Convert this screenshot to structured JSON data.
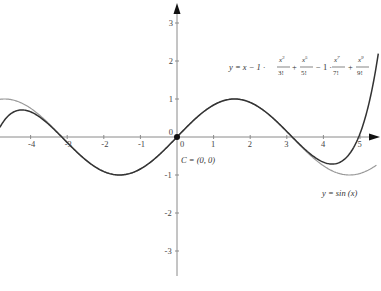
{
  "chart_data": {
    "type": "line",
    "title": "",
    "xlabel": "",
    "ylabel": "",
    "xlim": [
      -4.84,
      5.5
    ],
    "ylim": [
      -3.6,
      3.5
    ],
    "grid": false,
    "x_ticks": [
      -4,
      -3,
      -2,
      -1,
      0,
      1,
      2,
      3,
      4,
      5
    ],
    "x_tick_labels": [
      "-4",
      "-3",
      "-2",
      "-1",
      "0",
      "1",
      "2",
      "3",
      "4",
      "5"
    ],
    "y_ticks": [
      -3,
      -2,
      -1,
      0,
      1,
      2,
      3
    ],
    "y_tick_labels": [
      "-3",
      "-2",
      "-1",
      "0",
      "1",
      "2",
      "3"
    ],
    "series": [
      {
        "name": "y = sin (x)",
        "function": "sin",
        "color": "#9a9a9a",
        "x": [
          -4.8,
          -4,
          -3,
          -2,
          -1,
          0,
          1,
          2,
          3,
          4,
          5,
          5.4
        ],
        "values": [
          1.0,
          0.76,
          -0.14,
          -0.91,
          -0.84,
          0,
          0.84,
          0.91,
          0.14,
          -0.76,
          -0.96,
          -0.77
        ]
      },
      {
        "name": "y = x-1·x^3/3! + x^5/5! -1·x^7/7! + x^9/9!",
        "function": "taylor9",
        "color": "#333333",
        "x": [
          -4.8,
          -4.3,
          -4,
          -3,
          -2,
          -1,
          0,
          1,
          2,
          3,
          4,
          4.3,
          5,
          5.5
        ],
        "values": [
          0.5,
          0.66,
          0.62,
          -0.14,
          -0.91,
          -0.84,
          0,
          0.84,
          0.91,
          0.14,
          -0.62,
          -0.66,
          0.07,
          1.3
        ]
      }
    ],
    "annotations": [
      {
        "text": "C = (0, 0)",
        "x": 0,
        "y": 0,
        "type": "point"
      },
      {
        "text": "y = sin (x)",
        "near_series": "sin"
      },
      {
        "text": "y = x − 1 · x³/3! + x⁵/5! − 1 · x⁷/7! + x⁹/9!",
        "near_series": "taylor9"
      }
    ],
    "legend": "none"
  },
  "labels": {
    "point_c": "C = (0, 0)",
    "sin_label": "y = sin (x)",
    "taylor": {
      "lhs": "y = x − 1 ·",
      "t1_num": "x",
      "t1_exp": "3",
      "t1_den": "3!",
      "op1": "+",
      "t2_num": "x",
      "t2_exp": "5",
      "t2_den": "5!",
      "op2": "− 1 ·",
      "t3_num": "x",
      "t3_exp": "7",
      "t3_den": "7!",
      "op3": "+",
      "t4_num": "x",
      "t4_exp": "9",
      "t4_den": "9!"
    }
  },
  "style": {
    "axis_color": "#8a8a8a",
    "sin_color": "#9a9a9a",
    "taylor_color": "#2e2e2e",
    "point_color": "#111111"
  }
}
